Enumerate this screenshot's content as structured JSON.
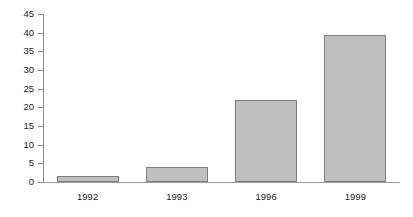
{
  "chart_data": {
    "type": "bar",
    "title": "",
    "subtitle": "",
    "xlabel": "",
    "ylabel": "",
    "categories": [
      "1992",
      "1993",
      "1996",
      "1999"
    ],
    "values": [
      1.7,
      3.9,
      22,
      39.5
    ],
    "series": [
      {
        "name": "",
        "values": [
          1.7,
          3.9,
          22,
          39.5
        ]
      }
    ],
    "ylim": [
      0,
      45
    ],
    "ytick_labels": [
      "0",
      "5",
      "10",
      "15",
      "20",
      "25",
      "30",
      "35",
      "40",
      "45"
    ],
    "ytick_values": [
      0,
      5,
      10,
      15,
      20,
      25,
      30,
      35,
      40,
      45
    ],
    "grid": false,
    "legend": false,
    "legend_position": "none",
    "annotations": []
  },
  "style": {
    "bar_fill": "#bfbfbf",
    "bar_border": "#7f7f7f",
    "axis_color": "#8a8a8a",
    "text_color": "#1a1a1a",
    "background": "#ffffff"
  }
}
